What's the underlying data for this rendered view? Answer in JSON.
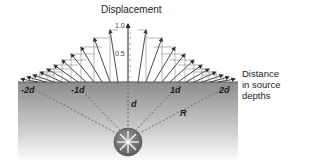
{
  "diagram": {
    "title": "Displacement",
    "axis": {
      "ticks": [
        {
          "value": 1.0,
          "label": "1.0"
        },
        {
          "value": 0.5,
          "label": "0.5"
        }
      ]
    },
    "side_label": {
      "line1": "Distance",
      "line2": "in source",
      "line3": "depths"
    },
    "surface_labels": [
      {
        "label": "-2d",
        "x": 28
      },
      {
        "label": "-1d",
        "x": 77
      },
      {
        "label": "1d",
        "x": 175
      },
      {
        "label": "2d",
        "x": 224
      }
    ],
    "depth_label": "d",
    "radius_label": "R",
    "source_icon": "explosion-source-icon",
    "colors": {
      "ground_top": "#8a8a8a",
      "ground_bottom": "#ffffff",
      "vector": "#333333",
      "dashed": "#6a6a6a",
      "source": "#7a7a7a"
    }
  }
}
